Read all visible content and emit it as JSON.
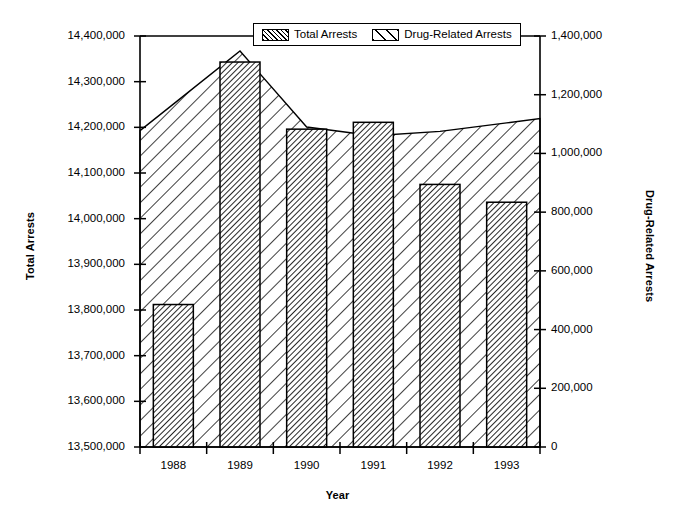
{
  "chart_data": {
    "type": "bar",
    "title": "",
    "subtitle": "",
    "xlabel": "Year",
    "ylabel": "Total Arrests",
    "ylabel_secondary": "Drug-Related Arrests",
    "categories": [
      "1988",
      "1989",
      "1990",
      "1991",
      "1992",
      "1993"
    ],
    "ylim": [
      13500000,
      14400000
    ],
    "ylim_secondary": [
      0,
      1400000
    ],
    "y_ticks": [
      "13,500,000",
      "13,600,000",
      "13,700,000",
      "13,800,000",
      "13,900,000",
      "14,000,000",
      "14,100,000",
      "14,200,000",
      "14,300,000",
      "14,400,000"
    ],
    "y_tick_values": [
      13500000,
      13600000,
      13700000,
      13800000,
      13900000,
      14000000,
      14100000,
      14200000,
      14300000,
      14400000
    ],
    "y_ticks_secondary": [
      "0",
      "200,000",
      "400,000",
      "600,000",
      "800,000",
      "1,000,000",
      "1,200,000",
      "1,400,000"
    ],
    "y_tick_values_secondary": [
      0,
      200000,
      400000,
      600000,
      800000,
      1000000,
      1200000,
      1400000
    ],
    "grid": false,
    "legend_position": "top-center",
    "series": [
      {
        "name": "Total Arrests",
        "render": "bar",
        "axis": "left",
        "fill": "dense-diagonal-hatch",
        "values": [
          13812000,
          14343000,
          14196000,
          14211000,
          14075000,
          14036000
        ]
      },
      {
        "name": "Drug-Related Arrests",
        "render": "area",
        "axis": "right",
        "fill": "sparse-diagonal-hatch",
        "values": [
          1168000,
          1349000,
          1090000,
          1060000,
          1075000,
          1104000
        ]
      }
    ]
  },
  "legend": {
    "items": [
      {
        "label": "Total Arrests",
        "swatch": "dense-diagonal-hatch"
      },
      {
        "label": "Drug-Related Arrests",
        "swatch": "sparse-diagonal-hatch"
      }
    ]
  },
  "colors": {
    "axis": "#000000",
    "bar_outline": "#000000",
    "bar_hatch": "#000000",
    "area_outline": "#000000",
    "area_hatch": "#000000",
    "background": "#ffffff"
  }
}
